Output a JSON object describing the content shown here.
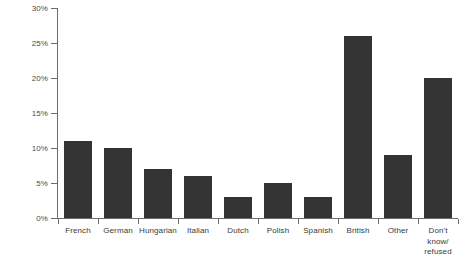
{
  "chart_data": {
    "type": "bar",
    "title": "",
    "subtitle": "",
    "xlabel": "",
    "ylabel": "",
    "ylim": [
      0,
      30
    ],
    "ytick_values": [
      0,
      5,
      10,
      15,
      20,
      25,
      30
    ],
    "ytick_labels": [
      "0%",
      "5%",
      "10%",
      "15%",
      "20%",
      "25%",
      "30%"
    ],
    "grid": false,
    "legend": null,
    "bar_color": "#333333",
    "axis_color": "#6d6d6d",
    "categories": [
      "French",
      "German",
      "Hungarian",
      "Italian",
      "Dutch",
      "Polish",
      "Spanish",
      "British",
      "Other",
      "Don't\nknow/\nrefused"
    ],
    "values": [
      11,
      10,
      7,
      6,
      3,
      5,
      3,
      26,
      9,
      20
    ],
    "value_labels": [
      "11%",
      "10%",
      "7%",
      "6%",
      "3%",
      "5%",
      "3%",
      "26%",
      "9%",
      "20%"
    ]
  }
}
